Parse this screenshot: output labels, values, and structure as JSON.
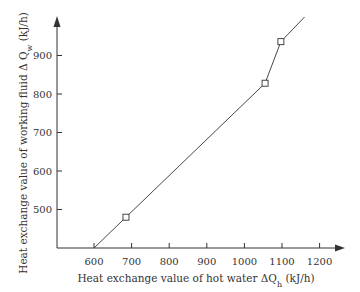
{
  "chart_data": {
    "type": "line",
    "title": "",
    "xlabel": "Heat exchange value of hot water ΔQh (kJ/h)",
    "ylabel": "Heat exchange value of working fluid ΔQw (kJ/h)",
    "xlabel_parts": {
      "prefix": "Heat exchange value of hot water ΔQ",
      "sub": "h",
      "suffix": " (kJ/h)"
    },
    "ylabel_parts": {
      "prefix": "Heat exchange value of working fluid Δ Q",
      "sub": "w",
      "suffix": " (kJ/h)"
    },
    "x_ticks": [
      600,
      700,
      800,
      900,
      1000,
      1100,
      1200
    ],
    "y_ticks": [
      500,
      600,
      700,
      800,
      900
    ],
    "xlim": [
      500,
      1260
    ],
    "ylim": [
      400,
      1010
    ],
    "grid": false,
    "legend": null,
    "series": [
      {
        "name": "ΔQw vs ΔQh",
        "line_points": [
          {
            "x": 600,
            "y": 400
          },
          {
            "x": 685,
            "y": 480
          },
          {
            "x": 1055,
            "y": 828
          },
          {
            "x": 1097,
            "y": 936
          },
          {
            "x": 1160,
            "y": 1000
          }
        ],
        "markers": [
          {
            "x": 685,
            "y": 480
          },
          {
            "x": 1055,
            "y": 828
          },
          {
            "x": 1097,
            "y": 936
          }
        ],
        "marker": "square",
        "color": "#333333"
      }
    ]
  }
}
